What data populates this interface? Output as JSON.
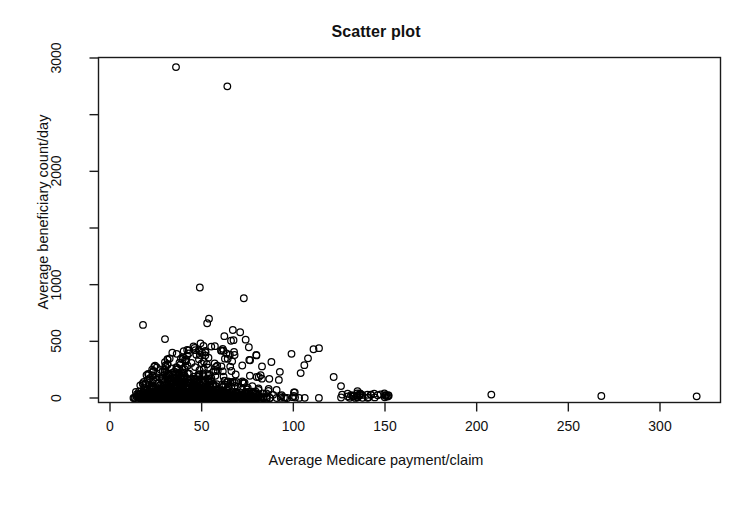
{
  "chart_data": {
    "type": "scatter",
    "title": "Scatter plot",
    "xlabel": "Average Medicare payment/claim",
    "ylabel": "Average beneficiary count/day",
    "xlim": [
      0,
      330
    ],
    "ylim": [
      0,
      3050
    ],
    "xticks": [
      0,
      50,
      100,
      150,
      200,
      250,
      300
    ],
    "xtick_labels": [
      "0",
      "50",
      "100",
      "150",
      "200",
      "250",
      "300"
    ],
    "yticks": [
      0,
      500,
      1000,
      1500,
      2000,
      2500,
      3000
    ],
    "ytick_labels": [
      "0",
      "500",
      "1000",
      "",
      "2000",
      "",
      "3000"
    ],
    "grid": false,
    "legend": null,
    "marker": "open-circle",
    "marker_size": 7,
    "marker_color": "#000000",
    "n_points": 1420,
    "notable_points": [
      {
        "x": 36,
        "y": 2920
      },
      {
        "x": 64,
        "y": 2750
      },
      {
        "x": 49,
        "y": 975
      },
      {
        "x": 73,
        "y": 880
      },
      {
        "x": 54,
        "y": 700
      },
      {
        "x": 53,
        "y": 660
      },
      {
        "x": 18,
        "y": 645
      },
      {
        "x": 67,
        "y": 600
      },
      {
        "x": 71,
        "y": 580
      },
      {
        "x": 30,
        "y": 520
      },
      {
        "x": 74,
        "y": 515
      },
      {
        "x": 66,
        "y": 505
      },
      {
        "x": 51,
        "y": 460
      },
      {
        "x": 114,
        "y": 440
      },
      {
        "x": 111,
        "y": 430
      },
      {
        "x": 34,
        "y": 400
      },
      {
        "x": 99,
        "y": 390
      },
      {
        "x": 108,
        "y": 350
      },
      {
        "x": 106,
        "y": 290
      },
      {
        "x": 104,
        "y": 220
      },
      {
        "x": 122,
        "y": 185
      },
      {
        "x": 126,
        "y": 105
      },
      {
        "x": 135,
        "y": 60
      },
      {
        "x": 146,
        "y": 25
      },
      {
        "x": 150,
        "y": 22
      },
      {
        "x": 152,
        "y": 20
      },
      {
        "x": 208,
        "y": 30
      },
      {
        "x": 268,
        "y": 18
      },
      {
        "x": 320,
        "y": 15
      }
    ]
  },
  "axes": {
    "title_text": "Scatter plot",
    "x_label_text": "Average Medicare payment/claim",
    "y_label_text": "Average beneficiary count/day"
  }
}
